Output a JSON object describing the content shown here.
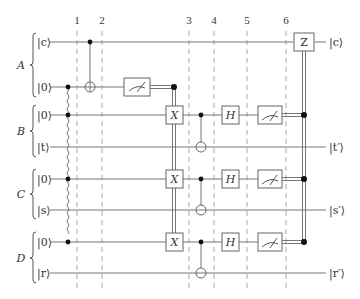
{
  "diagram": {
    "type": "quantum-circuit",
    "step_labels": [
      "1",
      "2",
      "3",
      "4",
      "5",
      "6"
    ],
    "registers": [
      {
        "name": "A",
        "qubits": [
          {
            "input": "|c⟩",
            "output": "|c⟩"
          },
          {
            "input": "|0⟩",
            "output": ""
          }
        ]
      },
      {
        "name": "B",
        "qubits": [
          {
            "input": "|0⟩",
            "output": ""
          },
          {
            "input": "|t⟩",
            "output": "|t′⟩"
          }
        ]
      },
      {
        "name": "C",
        "qubits": [
          {
            "input": "|0⟩",
            "output": ""
          },
          {
            "input": "|s⟩",
            "output": "|s′⟩"
          }
        ]
      },
      {
        "name": "D",
        "qubits": [
          {
            "input": "|0⟩",
            "output": ""
          },
          {
            "input": "|r⟩",
            "output": "|r′⟩"
          }
        ]
      }
    ],
    "gates": {
      "x_label": "X",
      "h_label": "H",
      "z_label": "Z"
    },
    "labels": {
      "reg_a": "A",
      "reg_b": "B",
      "reg_c": "C",
      "reg_d": "D",
      "in_c": "|c⟩",
      "in_a0": "|0⟩",
      "in_b0": "|0⟩",
      "in_t": "|t⟩",
      "in_c0": "|0⟩",
      "in_s": "|s⟩",
      "in_d0": "|0⟩",
      "in_r": "|r⟩",
      "out_c": "|c⟩",
      "out_t": "|t′⟩",
      "out_s": "|s′⟩",
      "out_r": "|r′⟩",
      "step1": "1",
      "step2": "2",
      "step3": "3",
      "step4": "4",
      "step5": "5",
      "step6": "6"
    }
  }
}
